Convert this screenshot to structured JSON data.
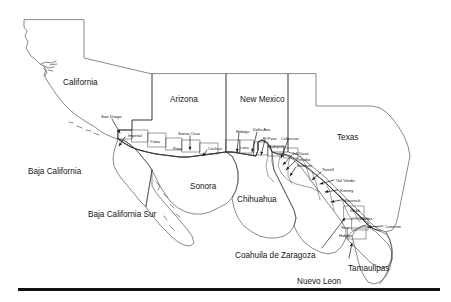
{
  "figure": {
    "name": "us-mexico-border-region-map",
    "type": "map",
    "projection_extent": "United States southwest border states and northern Mexico",
    "background_color": "#ffffff",
    "outline_color": "#3a3a3a",
    "label_color": "#161616",
    "rule_color": "#111111"
  },
  "states": [
    {
      "label": "California",
      "x": 63,
      "y": 79,
      "country": "US"
    },
    {
      "label": "Arizona",
      "x": 170,
      "y": 96,
      "country": "US"
    },
    {
      "label": "New Mexico",
      "x": 240,
      "y": 96,
      "country": "US"
    },
    {
      "label": "Texas",
      "x": 337,
      "y": 134,
      "country": "US"
    },
    {
      "label": "Baja California",
      "x": 28,
      "y": 168,
      "country": "MX"
    },
    {
      "label": "Baja California Sur",
      "x": 88,
      "y": 211,
      "country": "MX"
    },
    {
      "label": "Sonora",
      "x": 190,
      "y": 183,
      "country": "MX"
    },
    {
      "label": "Chihuahua",
      "x": 237,
      "y": 196,
      "country": "MX"
    },
    {
      "label": "Coahuila de Zaragoza",
      "x": 235,
      "y": 252,
      "country": "MX"
    },
    {
      "label": "Nuevo Leon",
      "x": 297,
      "y": 278,
      "country": "MX"
    },
    {
      "label": "Tamaulipas",
      "x": 348,
      "y": 265,
      "country": "MX"
    }
  ],
  "counties": [
    {
      "label": "San Diego",
      "x": 101,
      "y": 115,
      "size": "county",
      "state": "California"
    },
    {
      "label": "Imperial",
      "x": 128,
      "y": 134,
      "size": "county-sm",
      "state": "California"
    },
    {
      "label": "Yuma",
      "x": 150,
      "y": 140,
      "size": "county-sm",
      "state": "Arizona"
    },
    {
      "label": "Pima",
      "x": 173,
      "y": 147,
      "size": "county-sm",
      "state": "Arizona"
    },
    {
      "label": "Santa Cruz",
      "x": 178,
      "y": 132,
      "size": "county",
      "state": "Arizona"
    },
    {
      "label": "Cochise",
      "x": 208,
      "y": 147,
      "size": "county-sm",
      "state": "Arizona"
    },
    {
      "label": "Hidalgo",
      "x": 236,
      "y": 130,
      "size": "county-sm",
      "state": "New Mexico"
    },
    {
      "label": "Luna",
      "x": 240,
      "y": 146,
      "size": "county-sm",
      "state": "New Mexico"
    },
    {
      "label": "Doña Ana",
      "x": 253,
      "y": 128,
      "size": "county-sm",
      "state": "New Mexico"
    },
    {
      "label": "El Paso",
      "x": 263,
      "y": 137,
      "size": "county-sm",
      "state": "Texas"
    },
    {
      "label": "Hudspeth",
      "x": 268,
      "y": 145,
      "size": "county-sm",
      "state": "Texas"
    },
    {
      "label": "Culberson",
      "x": 281,
      "y": 137,
      "size": "county-sm",
      "state": "Texas"
    },
    {
      "label": "Jeff Davis",
      "x": 292,
      "y": 152,
      "size": "county-sm",
      "state": "Texas"
    },
    {
      "label": "Presidio",
      "x": 296,
      "y": 158,
      "size": "county-sm",
      "state": "Texas"
    },
    {
      "label": "Brewster",
      "x": 297,
      "y": 164,
      "size": "county-sm",
      "state": "Texas"
    },
    {
      "label": "Terrell",
      "x": 322,
      "y": 168,
      "size": "county",
      "state": "Texas"
    },
    {
      "label": "Val Verde",
      "x": 336,
      "y": 179,
      "size": "county",
      "state": "Texas"
    },
    {
      "label": "Kinney",
      "x": 340,
      "y": 189,
      "size": "county",
      "state": "Texas"
    },
    {
      "label": "Maverick",
      "x": 343,
      "y": 199,
      "size": "county",
      "state": "Texas"
    },
    {
      "label": "Webb",
      "x": 350,
      "y": 209,
      "size": "county-sm",
      "state": "Texas"
    },
    {
      "label": "Zapata",
      "x": 360,
      "y": 217,
      "size": "county-sm",
      "state": "Texas"
    },
    {
      "label": "Starr",
      "x": 341,
      "y": 226,
      "size": "county-sm",
      "state": "Texas"
    },
    {
      "label": "Hidalgo",
      "x": 339,
      "y": 234,
      "size": "county-sm",
      "state": "Texas"
    },
    {
      "label": "Cameron",
      "x": 385,
      "y": 225,
      "size": "county-sm",
      "state": "Texas"
    }
  ],
  "leaders": [
    {
      "name": "leader-san-diego",
      "x1": 112,
      "y1": 119,
      "x2": 120,
      "y2": 133
    },
    {
      "name": "leader-imperial",
      "x1": 125,
      "y1": 137,
      "x2": 119,
      "y2": 146
    },
    {
      "name": "leader-santa-cruz",
      "x1": 190,
      "y1": 136,
      "x2": 190,
      "y2": 150
    },
    {
      "name": "leader-cochise",
      "x1": 207,
      "y1": 150,
      "x2": 203,
      "y2": 156
    },
    {
      "name": "leader-hidalgo-nm",
      "x1": 239,
      "y1": 133,
      "x2": 237,
      "y2": 152
    },
    {
      "name": "leader-dona-ana",
      "x1": 257,
      "y1": 132,
      "x2": 252,
      "y2": 152
    },
    {
      "name": "leader-el-paso",
      "x1": 265,
      "y1": 140,
      "x2": 261,
      "y2": 155
    },
    {
      "name": "leader-culberson",
      "x1": 288,
      "y1": 140,
      "x2": 281,
      "y2": 158
    },
    {
      "name": "leader-jeff-davis",
      "x1": 292,
      "y1": 155,
      "x2": 283,
      "y2": 165
    },
    {
      "name": "leader-presidio",
      "x1": 295,
      "y1": 161,
      "x2": 286,
      "y2": 170
    },
    {
      "name": "leader-brewster",
      "x1": 296,
      "y1": 167,
      "x2": 290,
      "y2": 176
    },
    {
      "name": "leader-terrell",
      "x1": 321,
      "y1": 172,
      "x2": 312,
      "y2": 180
    },
    {
      "name": "leader-val-verde",
      "x1": 334,
      "y1": 180,
      "x2": 320,
      "y2": 184
    },
    {
      "name": "leader-kinney",
      "x1": 338,
      "y1": 190,
      "x2": 325,
      "y2": 192
    },
    {
      "name": "leader-maverick",
      "x1": 341,
      "y1": 200,
      "x2": 331,
      "y2": 202
    },
    {
      "name": "leader-cameron",
      "x1": 383,
      "y1": 226,
      "x2": 368,
      "y2": 227
    },
    {
      "name": "leader-coahuila",
      "x1": 322,
      "y1": 248,
      "x2": 345,
      "y2": 218
    },
    {
      "name": "leader-tamaulipas",
      "x1": 349,
      "y1": 258,
      "x2": 352,
      "y2": 243
    }
  ],
  "rule": {
    "label": "bottom-divider",
    "x": 18,
    "y": 288,
    "width": 422,
    "height": 3
  }
}
